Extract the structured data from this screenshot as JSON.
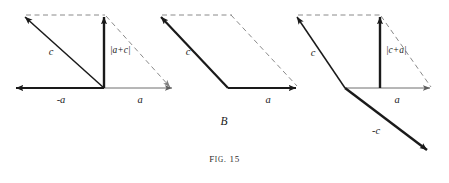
{
  "figure": {
    "caption_prefix": "F",
    "caption_prefix_rest": "IG",
    "caption_dot": ".",
    "caption_number": "15",
    "caption_full": "Fig. 15",
    "background_color": "#ffffff",
    "ink_color": "#1a1a1a",
    "dash_color": "#8a8a8a",
    "thin_color": "#6e6e6e"
  },
  "panels": [
    {
      "id": "panel-a",
      "name": "vector-sum-a-plus-c",
      "labels": {
        "c": "c",
        "minus_a": "-a",
        "a": "a",
        "magnitude": "|a+c|"
      }
    },
    {
      "id": "panel-b",
      "name": "vector-sum-parallelogram-b",
      "labels": {
        "c": "c",
        "a": "a",
        "panel_letter": "B"
      }
    },
    {
      "id": "panel-c",
      "name": "vector-sum-c-plus-a",
      "labels": {
        "c": "c",
        "minus_c": "-c",
        "a": "a",
        "magnitude": "|c+a|"
      }
    }
  ]
}
